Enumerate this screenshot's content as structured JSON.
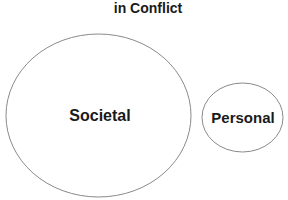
{
  "diagram": {
    "title_partial": "in Conflict",
    "shapes": [
      {
        "id": "societal",
        "label": "Societal",
        "cx": 98.5,
        "cy": 115.5,
        "rx": 92.5,
        "ry": 81.5
      },
      {
        "id": "personal",
        "label": "Personal",
        "cx": 242.5,
        "cy": 117.5,
        "rx": 40.5,
        "ry": 34.5
      }
    ],
    "colors": {
      "stroke": "#8a8a8a",
      "text": "#1a1a1a",
      "background": "#ffffff"
    }
  }
}
